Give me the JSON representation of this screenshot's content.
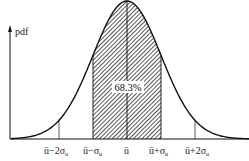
{
  "chart_data": {
    "type": "area",
    "title": "",
    "ylabel": "pdf",
    "xlabel": "",
    "grid": false,
    "legend": null,
    "distribution": {
      "name": "normal",
      "mean": 0,
      "std": 1
    },
    "x_ticks": [
      -2,
      -1,
      0,
      1,
      2
    ],
    "tick_labels": [
      "ū−2σᵤ",
      "ū−σᵤ",
      "ū",
      "ū+σᵤ",
      "ū+2σᵤ"
    ],
    "shaded_region": {
      "from": -1,
      "to": 1,
      "pattern": "hatched",
      "label": "68.3%"
    },
    "annotations": [
      "68.3%"
    ],
    "colors": {
      "line": "#111111",
      "hatch": "#333333",
      "background": "#ffffff"
    }
  },
  "axis": {
    "y_label": "pdf"
  },
  "ticks": {
    "m2": {
      "main": "ū",
      "suffix": "−2σ",
      "sub": "u"
    },
    "m1": {
      "main": "ū",
      "suffix": "−σ",
      "sub": "u"
    },
    "c": {
      "main": "ū"
    },
    "p1": {
      "main": "ū",
      "suffix": "+σ",
      "sub": "u"
    },
    "p2": {
      "main": "ū",
      "suffix": "+2σ",
      "sub": "u"
    }
  },
  "shade": {
    "label": "68.3%"
  }
}
